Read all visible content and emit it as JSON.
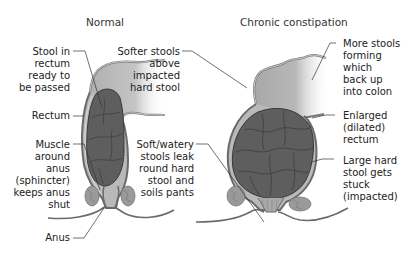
{
  "diagram": {
    "panels": [
      {
        "title": "Normal",
        "labels": [
          {
            "text": "Stool in\nrectum\nready to\nbe passed"
          },
          {
            "text": "Rectum"
          },
          {
            "text": "Muscle\naround\nanus\n(sphincter)\nkeeps anus\nshut"
          },
          {
            "text": "Anus"
          }
        ]
      },
      {
        "title": "Chronic constipation",
        "labels": [
          {
            "text": "Softer stools\nabove\nimpacted\nhard stool"
          },
          {
            "text": "More stools\nforming\nwhich\nback up\ninto colon"
          },
          {
            "text": "Enlarged\n(dilated)\nrectum"
          },
          {
            "text": "Large hard\nstool gets\nstuck\n(impacted)"
          },
          {
            "text": "Soft/watery\nstools leak\nround hard\nstool and\nsoils pants"
          }
        ]
      }
    ],
    "colors": {
      "colon_fill": "#b5b5b5",
      "stool_fill": "#5e5e5e",
      "wall_stroke": "#6a6a6a",
      "muscle_fill": "#9a9a9a",
      "leader_line": "#333333"
    }
  }
}
